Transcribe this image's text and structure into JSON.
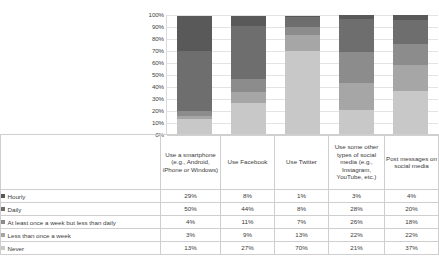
{
  "chart_data": {
    "type": "bar",
    "subtype": "stacked-100-percent-column",
    "title": "",
    "xlabel": "",
    "ylabel": "",
    "ylim": [
      0,
      100
    ],
    "grid": true,
    "legend_position": "left-table",
    "categories": [
      "Use a smartphone (e.g., Android, iPhone or Windows)",
      "Use Facebook",
      "Use Twitter",
      "Use some other types of social media (e.g., Instagram, YouTube, etc.)",
      "Post messages on social media"
    ],
    "ytick_labels": [
      "100%",
      "90%",
      "80%",
      "70%",
      "60%",
      "50%",
      "40%",
      "30%",
      "20%",
      "10%",
      "0%"
    ],
    "series": [
      {
        "name": "Hourly",
        "values": [
          29,
          8,
          1,
          3,
          4
        ],
        "color": "#595959"
      },
      {
        "name": "Daily",
        "values": [
          50,
          44,
          8,
          28,
          20
        ],
        "color": "#6e6e6e"
      },
      {
        "name": "At least once a week but less than daily",
        "values": [
          4,
          11,
          7,
          26,
          18
        ],
        "color": "#8c8c8c"
      },
      {
        "name": "Less than once a week",
        "values": [
          3,
          9,
          13,
          22,
          22
        ],
        "color": "#a6a6a6"
      },
      {
        "name": "Never",
        "values": [
          13,
          27,
          70,
          21,
          37
        ],
        "color": "#c8c8c8"
      }
    ]
  },
  "table": {
    "category_headers": [
      "Use a smartphone (e.g., Android, iPhone or Windows)",
      "Use Facebook",
      "Use Twitter",
      "Use some other types of social media (e.g., Instagram, YouTube, etc.)",
      "Post messages on social media"
    ],
    "rows": [
      {
        "label": "Hourly",
        "values": [
          "29%",
          "8%",
          "1%",
          "3%",
          "4%"
        ]
      },
      {
        "label": "Daily",
        "values": [
          "50%",
          "44%",
          "8%",
          "28%",
          "20%"
        ]
      },
      {
        "label": "At least once a week but less than daily",
        "values": [
          "4%",
          "11%",
          "7%",
          "26%",
          "18%"
        ]
      },
      {
        "label": "Less than once a week",
        "values": [
          "3%",
          "9%",
          "13%",
          "22%",
          "22%"
        ]
      },
      {
        "label": "Never",
        "values": [
          "13%",
          "27%",
          "70%",
          "21%",
          "37%"
        ]
      }
    ]
  },
  "colors": {
    "hourly": "#595959",
    "daily": "#6e6e6e",
    "weekly": "#8c8c8c",
    "less_than_weekly": "#a6a6a6",
    "never": "#c8c8c8",
    "gridline": "#e3e3e3",
    "border": "#cfcfcf",
    "text": "#3a3a3a"
  }
}
